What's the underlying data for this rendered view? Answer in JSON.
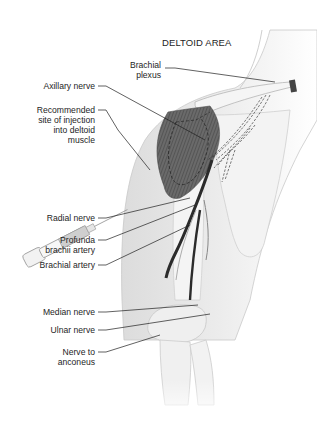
{
  "title": "DELTOID AREA",
  "labels": {
    "brachial_plexus": [
      "Brachial",
      "plexus"
    ],
    "axillary_nerve": [
      "Axillary nerve"
    ],
    "injection_site": [
      "Recommended",
      "site of injection",
      "into deltoid",
      "muscle"
    ],
    "radial_nerve": [
      "Radial nerve"
    ],
    "profunda_brachii": [
      "Profunda",
      "brachii artery"
    ],
    "brachial_artery": [
      "Brachial artery"
    ],
    "median_nerve": [
      "Median nerve"
    ],
    "ulnar_nerve": [
      "Ulnar nerve"
    ],
    "nerve_to_anconeus": [
      "Nerve to",
      "anconeus"
    ]
  },
  "colors": {
    "skin": "#e9e9e9",
    "bone": "#f4f4f4",
    "muscle": "#6e6e6e",
    "artery": "#2b2b2b",
    "leader": "#1e1e1e"
  }
}
